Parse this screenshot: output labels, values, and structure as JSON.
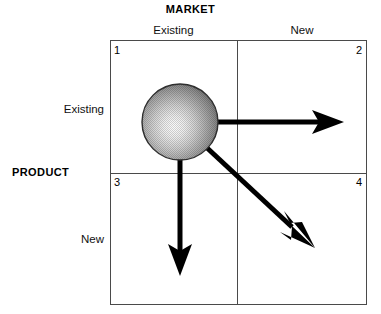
{
  "diagram": {
    "name": "Ansoff growth matrix",
    "column_axis_title": "MARKET",
    "row_axis_title": "PRODUCT",
    "column_headers": [
      "Existing",
      "New"
    ],
    "row_headers": [
      "Existing",
      "New"
    ],
    "quadrant_numbers": [
      "1",
      "2",
      "3",
      "4"
    ],
    "colors": {
      "frame": "#4a4a4a",
      "text": "#000000",
      "arrow": "#000000",
      "sphere_highlight": "#f2f2f2",
      "sphere_shadow": "#3c3c3c",
      "background": "#ffffff"
    },
    "sphere": {
      "name": "current-position-sphere",
      "center_x": 180,
      "center_y": 122,
      "radius": 38
    },
    "arrows": [
      {
        "name": "arrow-market-development",
        "from_x": 217,
        "from_y": 122,
        "to_x": 341,
        "to_y": 122,
        "direction": "right"
      },
      {
        "name": "arrow-diversification",
        "from_x": 207,
        "from_y": 149,
        "to_x": 312,
        "to_y": 246,
        "direction": "down-right"
      },
      {
        "name": "arrow-product-development",
        "from_x": 180,
        "from_y": 159,
        "to_x": 180,
        "to_y": 273,
        "direction": "down"
      }
    ]
  }
}
